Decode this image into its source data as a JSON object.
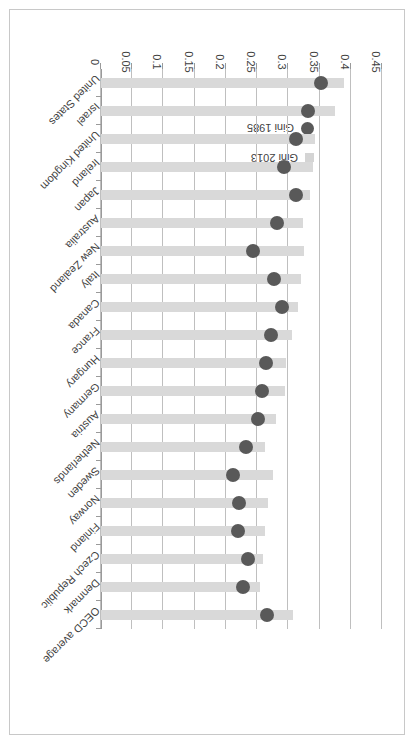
{
  "legend": {
    "items": [
      {
        "label": "Gini 2013",
        "marker": "square-marker",
        "color": "#d4d4d4"
      },
      {
        "label": "Gini 1985",
        "marker": "circle-marker",
        "color": "#595959"
      }
    ]
  },
  "axis": {
    "ticks": [
      "0.45",
      "0.4",
      "0.35",
      "0.3",
      "0.25",
      "0.2",
      "0.15",
      "0.1",
      "0.05",
      "0"
    ]
  },
  "chart_data": {
    "type": "bar",
    "title": "",
    "xlabel": "",
    "ylabel": "",
    "orientation": "horizontal",
    "xlim": [
      0,
      0.45
    ],
    "xticks": [
      0,
      0.05,
      0.1,
      0.15,
      0.2,
      0.25,
      0.3,
      0.35,
      0.4,
      0.45
    ],
    "grid": true,
    "legend_position": "upper-left",
    "categories": [
      "OECD average",
      "Denmark",
      "Czech Republic",
      "Finland",
      "Norway",
      "Sweden",
      "Netherlands",
      "Austria",
      "Germany",
      "Hungary",
      "France",
      "Canada",
      "Italy",
      "New Zealand",
      "Australia",
      "Japan",
      "Ireland",
      "United Kingdom",
      "Israel",
      "United States"
    ],
    "series": [
      {
        "name": "Gini 2013",
        "type": "bar",
        "color": "#d9d9d9",
        "values": [
          0.308,
          0.254,
          0.259,
          0.262,
          0.268,
          0.275,
          0.263,
          0.281,
          0.294,
          0.297,
          0.306,
          0.315,
          0.32,
          0.325,
          0.323,
          0.334,
          0.34,
          0.343,
          0.375,
          0.389
        ]
      },
      {
        "name": "Gini 1985",
        "type": "scatter",
        "color": "#595959",
        "values": [
          0.266,
          0.227,
          0.235,
          0.22,
          0.221,
          0.211,
          0.233,
          0.251,
          0.258,
          0.264,
          0.273,
          0.29,
          0.277,
          0.243,
          0.282,
          0.313,
          0.293,
          0.313,
          0.332,
          0.353
        ]
      }
    ]
  }
}
